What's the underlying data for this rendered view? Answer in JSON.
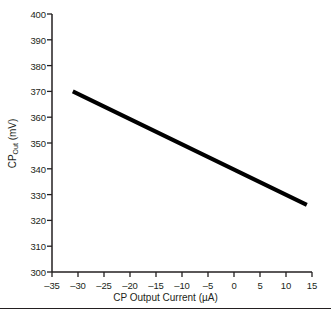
{
  "chart_data": {
    "type": "line",
    "title": "",
    "subtitle": "",
    "xlabel": "CP Output Current (µA)",
    "ylabel": "CP",
    "ylabel_sub": "Out",
    "ylabel_unit": " (mV)",
    "ylabel_full": "CP_Out (mV)",
    "xlim": [
      -35,
      15
    ],
    "ylim": [
      300,
      400
    ],
    "xticks": [
      -35,
      -30,
      -25,
      -20,
      -15,
      -10,
      -5,
      0,
      5,
      10,
      15
    ],
    "xtick_labels": [
      "–35",
      "–30",
      "–25",
      "–20",
      "–15",
      "–10",
      "–5",
      "0",
      "5",
      "10",
      "15"
    ],
    "yticks": [
      300,
      310,
      320,
      330,
      340,
      350,
      360,
      370,
      380,
      390,
      400
    ],
    "ytick_labels": [
      "300",
      "310",
      "320",
      "330",
      "340",
      "350",
      "360",
      "370",
      "380",
      "390",
      "400"
    ],
    "grid": false,
    "legend": null,
    "legend_position": "none",
    "spines": [
      "left",
      "bottom"
    ],
    "tick_direction": "out",
    "series": [
      {
        "name": "CP Output Voltage",
        "color": "#000000",
        "line_width": 4,
        "x": [
          -31,
          14
        ],
        "y": [
          370,
          326
        ]
      }
    ],
    "annotations": []
  },
  "figure": {
    "background_color": "#ffffff",
    "foreground_color": "#231f20",
    "footer_rule": true
  }
}
